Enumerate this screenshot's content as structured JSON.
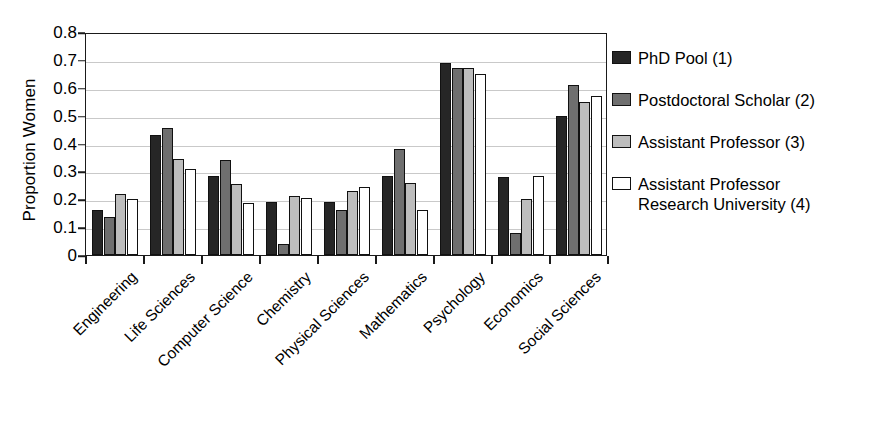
{
  "chart_data": {
    "type": "bar",
    "title": "",
    "xlabel": "",
    "ylabel": "Proportion Women",
    "ylim": [
      0,
      0.8
    ],
    "yticks": [
      "0",
      "0.1",
      "0.2",
      "0.3",
      "0.4",
      "0.5",
      "0.6",
      "0.7",
      "0.8"
    ],
    "ytick_values": [
      0,
      0.1,
      0.2,
      0.3,
      0.4,
      0.5,
      0.6,
      0.7,
      0.8
    ],
    "grid": true,
    "legend_position": "right",
    "categories": [
      "Engineering",
      "Life Sciences",
      "Computer Science",
      "Chemistry",
      "Physical Sciences",
      "Mathematics",
      "Psychology",
      "Economics",
      "Social Sciences"
    ],
    "series": [
      {
        "name": "PhD Pool (1)",
        "color": "#262626",
        "values": [
          0.16,
          0.43,
          0.285,
          0.19,
          0.19,
          0.285,
          0.69,
          0.28,
          0.5
        ]
      },
      {
        "name": "Postdoctoral Scholar (2)",
        "color": "#6f6f6f",
        "values": [
          0.135,
          0.455,
          0.34,
          0.04,
          0.16,
          0.38,
          0.67,
          0.08,
          0.61
        ]
      },
      {
        "name": "Assistant Professor (3)",
        "color": "#bdbdbd",
        "values": [
          0.22,
          0.345,
          0.255,
          0.21,
          0.23,
          0.26,
          0.67,
          0.2,
          0.55
        ]
      },
      {
        "name": "Assistant Professor Research University (4)",
        "color": "#ffffff",
        "values": [
          0.2,
          0.31,
          0.185,
          0.205,
          0.245,
          0.16,
          0.65,
          0.285,
          0.57
        ]
      }
    ]
  },
  "legend": {
    "entries": [
      {
        "label": "PhD Pool (1)",
        "label_line2": ""
      },
      {
        "label": "Postdoctoral Scholar (2)",
        "label_line2": ""
      },
      {
        "label": "Assistant Professor (3)",
        "label_line2": ""
      },
      {
        "label": "Assistant Professor",
        "label_line2": "Research University (4)"
      }
    ]
  }
}
